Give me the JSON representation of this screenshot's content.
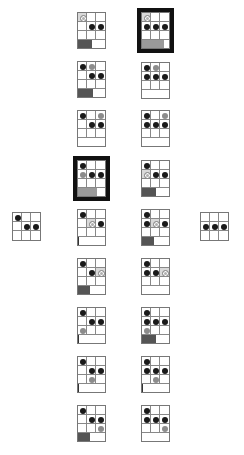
{
  "figure": {
    "colors": {
      "black_dot": "#1a1a1a",
      "gray_dot": "#8c8c8c",
      "ring_dot": "#b0b0b0",
      "bar_dark": "#555555",
      "bar_gray": "#9a9a9a",
      "highlight_border": "#111111"
    },
    "start_grid": {
      "x": 12,
      "y": 212,
      "dots": [
        {
          "r": 0,
          "c": 0,
          "t": "black"
        },
        {
          "r": 1,
          "c": 1,
          "t": "black"
        },
        {
          "r": 1,
          "c": 2,
          "t": "black"
        }
      ]
    },
    "goal_grid": {
      "x": 200,
      "y": 212,
      "dots": [
        {
          "r": 1,
          "c": 0,
          "t": "black"
        },
        {
          "r": 1,
          "c": 1,
          "t": "black"
        },
        {
          "r": 1,
          "c": 2,
          "t": "black"
        }
      ]
    },
    "left_column": [
      {
        "y": 12,
        "hl": false,
        "dots": [
          {
            "r": 0,
            "c": 0,
            "t": "ring"
          },
          {
            "r": 1,
            "c": 1,
            "t": "black"
          },
          {
            "r": 1,
            "c": 2,
            "t": "black"
          }
        ],
        "bar": {
          "fill": 0.5,
          "tone": "dark"
        }
      },
      {
        "y": 61,
        "hl": false,
        "dots": [
          {
            "r": 0,
            "c": 0,
            "t": "black"
          },
          {
            "r": 0,
            "c": 1,
            "t": "gray"
          },
          {
            "r": 1,
            "c": 1,
            "t": "black"
          },
          {
            "r": 1,
            "c": 2,
            "t": "black"
          }
        ],
        "bar": {
          "fill": 0.55,
          "tone": "dark"
        }
      },
      {
        "y": 110,
        "hl": false,
        "dots": [
          {
            "r": 0,
            "c": 0,
            "t": "black"
          },
          {
            "r": 0,
            "c": 2,
            "t": "gray"
          },
          {
            "r": 1,
            "c": 1,
            "t": "black"
          },
          {
            "r": 1,
            "c": 2,
            "t": "black"
          }
        ],
        "bar": {
          "fill": 0,
          "tone": "dark"
        }
      },
      {
        "y": 160,
        "hl": true,
        "dots": [
          {
            "r": 0,
            "c": 0,
            "t": "black"
          },
          {
            "r": 1,
            "c": 0,
            "t": "gray"
          },
          {
            "r": 1,
            "c": 1,
            "t": "black"
          },
          {
            "r": 1,
            "c": 2,
            "t": "black"
          }
        ],
        "bar": {
          "fill": 0.72,
          "tone": "gray"
        }
      },
      {
        "y": 209,
        "hl": false,
        "dots": [
          {
            "r": 0,
            "c": 0,
            "t": "black"
          },
          {
            "r": 1,
            "c": 1,
            "t": "ring"
          },
          {
            "r": 1,
            "c": 2,
            "t": "black"
          }
        ],
        "bar": {
          "fill": 0.03,
          "tone": "tick"
        }
      },
      {
        "y": 258,
        "hl": false,
        "dots": [
          {
            "r": 0,
            "c": 0,
            "t": "black"
          },
          {
            "r": 1,
            "c": 1,
            "t": "black"
          },
          {
            "r": 1,
            "c": 2,
            "t": "ring"
          }
        ],
        "bar": {
          "fill": 0.45,
          "tone": "dark"
        }
      },
      {
        "y": 307,
        "hl": false,
        "dots": [
          {
            "r": 0,
            "c": 0,
            "t": "black"
          },
          {
            "r": 1,
            "c": 1,
            "t": "black"
          },
          {
            "r": 1,
            "c": 2,
            "t": "black"
          },
          {
            "r": 2,
            "c": 0,
            "t": "gray"
          }
        ],
        "bar": {
          "fill": 0.03,
          "tone": "tick"
        }
      },
      {
        "y": 356,
        "hl": false,
        "dots": [
          {
            "r": 0,
            "c": 0,
            "t": "black"
          },
          {
            "r": 1,
            "c": 1,
            "t": "black"
          },
          {
            "r": 1,
            "c": 2,
            "t": "black"
          },
          {
            "r": 2,
            "c": 1,
            "t": "gray"
          }
        ],
        "bar": {
          "fill": 0.03,
          "tone": "tick"
        }
      },
      {
        "y": 405,
        "hl": false,
        "dots": [
          {
            "r": 0,
            "c": 0,
            "t": "black"
          },
          {
            "r": 1,
            "c": 1,
            "t": "black"
          },
          {
            "r": 1,
            "c": 2,
            "t": "black"
          },
          {
            "r": 2,
            "c": 2,
            "t": "gray"
          }
        ],
        "bar": {
          "fill": 0.45,
          "tone": "dark"
        }
      }
    ],
    "right_column": [
      {
        "y": 12,
        "hl": true,
        "dots": [
          {
            "r": 0,
            "c": 0,
            "t": "ring"
          },
          {
            "r": 1,
            "c": 0,
            "t": "black"
          },
          {
            "r": 1,
            "c": 1,
            "t": "black"
          },
          {
            "r": 1,
            "c": 2,
            "t": "black"
          }
        ],
        "bar": {
          "fill": 0.8,
          "tone": "gray"
        }
      },
      {
        "y": 62,
        "hl": false,
        "dots": [
          {
            "r": 0,
            "c": 0,
            "t": "black"
          },
          {
            "r": 0,
            "c": 1,
            "t": "gray"
          },
          {
            "r": 1,
            "c": 0,
            "t": "black"
          },
          {
            "r": 1,
            "c": 1,
            "t": "black"
          },
          {
            "r": 1,
            "c": 2,
            "t": "black"
          }
        ],
        "bar": {
          "fill": 0,
          "tone": "dark"
        }
      },
      {
        "y": 110,
        "hl": false,
        "dots": [
          {
            "r": 0,
            "c": 0,
            "t": "black"
          },
          {
            "r": 0,
            "c": 2,
            "t": "gray"
          },
          {
            "r": 1,
            "c": 0,
            "t": "black"
          },
          {
            "r": 1,
            "c": 1,
            "t": "black"
          },
          {
            "r": 1,
            "c": 2,
            "t": "black"
          }
        ],
        "bar": {
          "fill": 0,
          "tone": "dark"
        }
      },
      {
        "y": 160,
        "hl": false,
        "dots": [
          {
            "r": 0,
            "c": 0,
            "t": "black"
          },
          {
            "r": 1,
            "c": 0,
            "t": "ring"
          },
          {
            "r": 1,
            "c": 1,
            "t": "black"
          },
          {
            "r": 1,
            "c": 2,
            "t": "black"
          }
        ],
        "bar": {
          "fill": 0.5,
          "tone": "dark"
        }
      },
      {
        "y": 209,
        "hl": false,
        "dots": [
          {
            "r": 0,
            "c": 0,
            "t": "black"
          },
          {
            "r": 1,
            "c": 0,
            "t": "black"
          },
          {
            "r": 1,
            "c": 1,
            "t": "ring"
          },
          {
            "r": 1,
            "c": 2,
            "t": "black"
          }
        ],
        "bar": {
          "fill": 0.45,
          "tone": "dark"
        }
      },
      {
        "y": 258,
        "hl": false,
        "dots": [
          {
            "r": 0,
            "c": 0,
            "t": "black"
          },
          {
            "r": 1,
            "c": 0,
            "t": "black"
          },
          {
            "r": 1,
            "c": 1,
            "t": "black"
          },
          {
            "r": 1,
            "c": 2,
            "t": "ring"
          }
        ],
        "bar": {
          "fill": 0,
          "tone": "dark"
        }
      },
      {
        "y": 307,
        "hl": false,
        "dots": [
          {
            "r": 0,
            "c": 0,
            "t": "black"
          },
          {
            "r": 1,
            "c": 0,
            "t": "black"
          },
          {
            "r": 1,
            "c": 1,
            "t": "black"
          },
          {
            "r": 1,
            "c": 2,
            "t": "black"
          },
          {
            "r": 2,
            "c": 0,
            "t": "gray"
          }
        ],
        "bar": {
          "fill": 0.5,
          "tone": "dark"
        }
      },
      {
        "y": 356,
        "hl": false,
        "dots": [
          {
            "r": 0,
            "c": 0,
            "t": "black"
          },
          {
            "r": 1,
            "c": 0,
            "t": "black"
          },
          {
            "r": 1,
            "c": 1,
            "t": "black"
          },
          {
            "r": 1,
            "c": 2,
            "t": "black"
          },
          {
            "r": 2,
            "c": 1,
            "t": "gray"
          }
        ],
        "bar": {
          "fill": 0.03,
          "tone": "tick"
        }
      },
      {
        "y": 405,
        "hl": false,
        "dots": [
          {
            "r": 0,
            "c": 0,
            "t": "black"
          },
          {
            "r": 1,
            "c": 0,
            "t": "black"
          },
          {
            "r": 1,
            "c": 1,
            "t": "black"
          },
          {
            "r": 1,
            "c": 2,
            "t": "black"
          },
          {
            "r": 2,
            "c": 2,
            "t": "gray"
          }
        ],
        "bar": {
          "fill": 0,
          "tone": "dark"
        }
      }
    ],
    "column_x": {
      "left": 77,
      "right": 141
    }
  }
}
